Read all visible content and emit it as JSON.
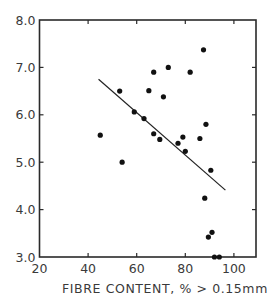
{
  "chart_data": {
    "type": "scatter",
    "title": "",
    "xlabel": "FIBRE CONTENT, % > 0.15mm",
    "ylabel": "",
    "xlim": [
      20,
      109
    ],
    "ylim": [
      3.0,
      8.0
    ],
    "x_ticks": [
      20,
      40,
      60,
      80,
      100
    ],
    "x_tick_labels": [
      "20",
      "40",
      "60",
      "80",
      "100"
    ],
    "y_ticks": [
      3.0,
      4.0,
      5.0,
      6.0,
      7.0,
      8.0
    ],
    "y_tick_labels": [
      "3.0",
      "4.0",
      "5.0",
      "6.0",
      "7.0",
      "8.0"
    ],
    "grid": false,
    "legend": null,
    "series": [
      {
        "name": "observations",
        "points": [
          {
            "x": 45,
            "y": 5.57
          },
          {
            "x": 53,
            "y": 6.5
          },
          {
            "x": 54,
            "y": 5.0
          },
          {
            "x": 59,
            "y": 6.06
          },
          {
            "x": 63,
            "y": 5.92
          },
          {
            "x": 65,
            "y": 6.51
          },
          {
            "x": 67,
            "y": 6.9
          },
          {
            "x": 67,
            "y": 5.6
          },
          {
            "x": 69.5,
            "y": 5.48
          },
          {
            "x": 71,
            "y": 6.38
          },
          {
            "x": 73,
            "y": 7.0
          },
          {
            "x": 77,
            "y": 5.4
          },
          {
            "x": 79,
            "y": 5.53
          },
          {
            "x": 80,
            "y": 5.23
          },
          {
            "x": 82,
            "y": 6.9
          },
          {
            "x": 86,
            "y": 5.5
          },
          {
            "x": 87.5,
            "y": 7.37
          },
          {
            "x": 88.5,
            "y": 5.8
          },
          {
            "x": 88,
            "y": 4.24
          },
          {
            "x": 90.5,
            "y": 4.83
          },
          {
            "x": 89.5,
            "y": 3.42
          },
          {
            "x": 91,
            "y": 3.52
          },
          {
            "x": 92,
            "y": 3.0
          },
          {
            "x": 94,
            "y": 3.0
          }
        ]
      }
    ],
    "fit_line": {
      "x1": 44.3,
      "y1": 6.75,
      "x2": 96.5,
      "y2": 4.41
    }
  }
}
